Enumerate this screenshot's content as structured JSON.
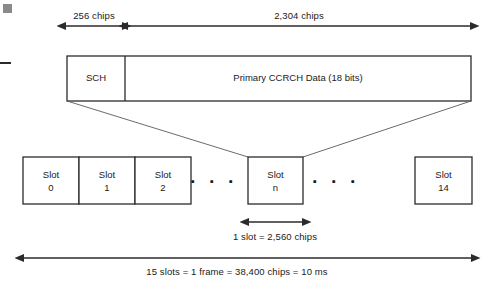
{
  "diagram": {
    "colors": {
      "line": "#3a3a3a",
      "box_border": "#2b2b2b",
      "text": "#1a1a1a",
      "background": "#ffffff",
      "corner_mark": "#8a8a8a"
    },
    "top_measures": [
      {
        "id": "sch-span",
        "label": "256 chips"
      },
      {
        "id": "data-span",
        "label": "2,304 chips"
      }
    ],
    "burst": {
      "sch_label": "SCH",
      "data_label": "Primary CCRCH Data (18 bits)"
    },
    "slots": [
      {
        "name": "Slot",
        "index": "0"
      },
      {
        "name": "Slot",
        "index": "1"
      },
      {
        "name": "Slot",
        "index": "2"
      },
      {
        "name": "Slot",
        "index": "n"
      },
      {
        "name": "Slot",
        "index": "14"
      }
    ],
    "ellipsis_left": "▪ ▪ ▪",
    "ellipsis_right": "▪ ▪ ▪",
    "slot_measure": "1 slot = 2,560 chips",
    "frame_measure": "15 slots = 1 frame = 38,400 chips = 10 ms"
  }
}
